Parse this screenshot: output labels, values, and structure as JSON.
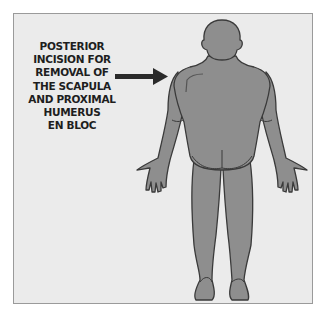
{
  "figure": {
    "caption_lines": [
      "POSTERIOR",
      "INCISION FOR",
      "REMOVAL OF",
      "THE SCAPULA",
      "AND PROXIMAL",
      "HUMERUS",
      "EN BLOC"
    ],
    "arrow_target": "left-shoulder-scapula",
    "colors": {
      "background": "#ebebeb",
      "frame_border": "#9a9a9a",
      "body_fill": "#8e8e8e",
      "body_outline": "#3a3a3a",
      "arrow": "#2a2a2a",
      "text": "#1e1e1e"
    }
  }
}
